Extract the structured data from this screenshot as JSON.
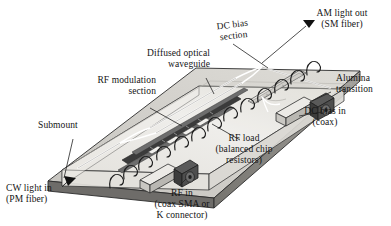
{
  "figure": {
    "type": "technical-line-diagram",
    "background": "#ffffff",
    "view": "isometric / oblique perspective, device axis running lower-left to upper-right"
  },
  "labels": {
    "am_light_out": {
      "line1": "AM light out",
      "line2": "(SM fiber)"
    },
    "dc_bias_section": {
      "line1": "DC bias",
      "line2": "section"
    },
    "diffused_waveguide": {
      "line1": "Diffused optical",
      "line2": "waveguide"
    },
    "rf_modulation_section": {
      "line1": "RF modulation",
      "line2": "section"
    },
    "alumina_transition": {
      "line1": "Alumina",
      "line2": "transition"
    },
    "dc_bias_in": {
      "line1": "DC bias in",
      "line2": "(coax)"
    },
    "rf_load": {
      "line1": "RF load",
      "line2": "(balanced chip",
      "line3": "resistors)"
    },
    "submount": {
      "line1": "Submount"
    },
    "cw_light_in": {
      "line1": "CW light in",
      "line2": "(PM fiber)"
    },
    "rf_in": {
      "line1": "RF in",
      "line2": "(coax SMA or",
      "line3": "K connector)"
    }
  },
  "parts": [
    {
      "id": "submount",
      "name": "Submount",
      "role": "metal base plate carrying the chip"
    },
    {
      "id": "chip",
      "name": "Lithium niobate chip",
      "role": "transparent electro-optic substrate"
    },
    {
      "id": "optical-waveguide",
      "name": "Diffused optical waveguide",
      "role": "Mach-Zehnder interferometer, Y-split and Y-combine"
    },
    {
      "id": "rf-electrode",
      "name": "RF modulation electrode",
      "role": "travelling-wave coplanar transmission line"
    },
    {
      "id": "dc-electrode",
      "name": "DC bias electrode",
      "role": "bias-point trim electrode downstream of RF section"
    },
    {
      "id": "alumina-transition",
      "name": "Alumina transition",
      "role": "ceramic launch between coax and chip electrode"
    },
    {
      "id": "rf-load",
      "name": "RF load (balanced chip resistors)",
      "role": "terminates the travelling-wave line"
    },
    {
      "id": "rf-connector",
      "name": "RF input coax connector",
      "role": "coax SMA or K connector"
    },
    {
      "id": "dc-connector",
      "name": "DC bias coax connector",
      "role": "coax feedthrough"
    },
    {
      "id": "wire-bonds",
      "name": "Wire bonds",
      "role": "ground and signal bond wires along electrode edges"
    },
    {
      "id": "fiber-in",
      "name": "PM fiber input port",
      "role": "CW light in"
    },
    {
      "id": "fiber-out",
      "name": "SM fiber output port",
      "role": "AM light out"
    }
  ],
  "colors": {
    "ink": "#141414",
    "outline": "#2b2b2b",
    "chip_glass": "#eceae6",
    "chip_top": "#e4e2dd",
    "submount_top": "#cfcdc8",
    "submount_side": "#8e8c88",
    "submount_front": "#6e6c69",
    "electrode_dark": "#3a3a3a",
    "electrode_mid": "#6a6a6a",
    "pad_light": "#f2f1ee",
    "connector_body": "#4a4a4a",
    "leader": "#2b2b2b"
  },
  "counts": {
    "wire_bonds": 13,
    "coax_connectors": 2,
    "fiber_ports": 2,
    "arrow_markers": 2
  }
}
